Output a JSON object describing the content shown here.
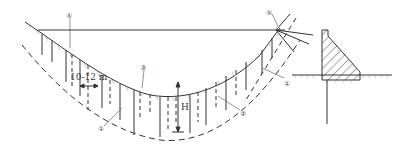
{
  "diagram": {
    "type": "dam cross-section with grout curtain and drainage holes",
    "labels": {
      "spacing": "10-12 m",
      "depth": "H",
      "callout_1": "①",
      "callout_2": "②",
      "callout_3": "③",
      "callout_4": "④",
      "callout_5": "⑤"
    },
    "colors": {
      "line": "#333333",
      "hatch": "#555555",
      "background": "#ffffff"
    }
  }
}
